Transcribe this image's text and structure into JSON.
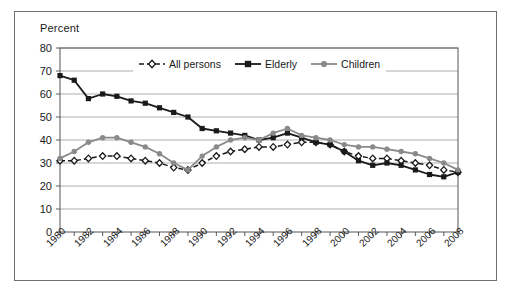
{
  "chart_data": {
    "type": "line",
    "title": "",
    "ylabel": "Percent",
    "xlabel": "",
    "ylim": [
      0,
      80
    ],
    "ytick_step": 10,
    "yticks": [
      0,
      10,
      20,
      30,
      40,
      50,
      60,
      70,
      80
    ],
    "xlim": [
      1980,
      2008
    ],
    "xticks": [
      1980,
      1981,
      1982,
      1983,
      1984,
      1985,
      1986,
      1987,
      1988,
      1989,
      1990,
      1991,
      1992,
      1993,
      1994,
      1995,
      1996,
      1997,
      1998,
      1999,
      2000,
      2001,
      2002,
      2003,
      2004,
      2005,
      2006,
      2007,
      2008
    ],
    "xtick_labels": [
      "1980",
      "1982",
      "1984",
      "1986",
      "1988",
      "1990",
      "1992",
      "1994",
      "1996",
      "1998",
      "2000",
      "2002",
      "2004",
      "2006",
      "2008"
    ],
    "xtick_label_years": [
      1980,
      1982,
      1984,
      1986,
      1988,
      1990,
      1992,
      1994,
      1996,
      1998,
      2000,
      2002,
      2004,
      2006,
      2008
    ],
    "grid": "horizontal",
    "legend_position": "top-center",
    "x": [
      1980,
      1981,
      1982,
      1983,
      1984,
      1985,
      1986,
      1987,
      1988,
      1989,
      1990,
      1991,
      1992,
      1993,
      1994,
      1995,
      1996,
      1997,
      1998,
      1999,
      2000,
      2001,
      2002,
      2003,
      2004,
      2005,
      2006,
      2007,
      2008
    ],
    "series": [
      {
        "name": "All persons",
        "color": "#1a1a1a",
        "style": "dashed",
        "marker": "open-diamond",
        "values": [
          31,
          31,
          32,
          33,
          33,
          32,
          31,
          30,
          28,
          27,
          30,
          33,
          35,
          36,
          37,
          37,
          38,
          39,
          39,
          38,
          35,
          33,
          32,
          32,
          31,
          30,
          29,
          27,
          26
        ]
      },
      {
        "name": "Elderly",
        "color": "#1a1a1a",
        "style": "solid",
        "marker": "filled-square",
        "values": [
          68,
          66,
          58,
          60,
          59,
          57,
          56,
          54,
          52,
          50,
          45,
          44,
          43,
          42,
          40,
          41,
          43,
          41,
          39,
          38,
          35,
          31,
          29,
          30,
          29,
          27,
          25,
          24,
          26
        ]
      },
      {
        "name": "Children",
        "color": "#8a8a8a",
        "style": "solid",
        "marker": "filled-circle",
        "values": [
          32,
          35,
          39,
          41,
          41,
          39,
          37,
          34,
          30,
          27,
          33,
          37,
          40,
          41,
          40,
          43,
          45,
          42,
          41,
          40,
          38,
          37,
          37,
          36,
          35,
          34,
          32,
          30,
          27
        ]
      }
    ]
  },
  "legend": {
    "items": [
      {
        "label": "All persons"
      },
      {
        "label": "Elderly"
      },
      {
        "label": "Children"
      }
    ]
  }
}
